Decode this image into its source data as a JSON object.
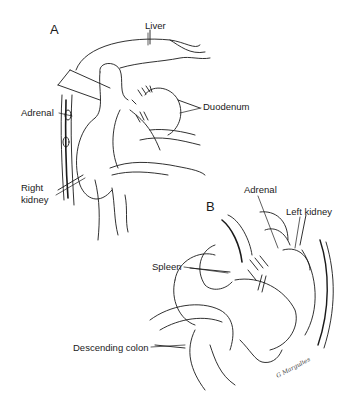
{
  "figure": {
    "panels": [
      {
        "id": "A",
        "label": "A",
        "labels": {
          "liver": "Liver",
          "adrenal": "Adrenal",
          "duodenum": "Duodenum",
          "right_kidney_line1": "Right",
          "right_kidney_line2": "kidney"
        }
      },
      {
        "id": "B",
        "label": "B",
        "labels": {
          "adrenal": "Adrenal",
          "left_kidney": "Left kidney",
          "spleen": "Spleen",
          "descending_colon": "Descending colon"
        }
      }
    ],
    "signature": "G Margulies",
    "colors": {
      "ink": "#1a1a1a",
      "background": "#ffffff"
    }
  }
}
